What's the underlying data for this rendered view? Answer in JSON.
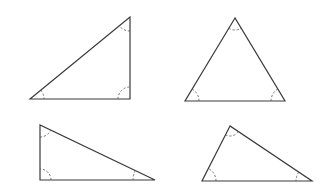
{
  "figure": {
    "background": "#ffffff",
    "line_color": "#3a3a3a",
    "arc_color": "#555555"
  },
  "triangles": [
    {
      "id": "triangle-top-left",
      "type": "right",
      "vertices": [
        [
          30,
          99
        ],
        [
          130,
          17
        ],
        [
          130,
          99
        ]
      ],
      "angle_marks": [
        {
          "vertex": [
            30,
            99
          ],
          "radius": 14
        },
        {
          "vertex": [
            130,
            17
          ],
          "radius": 14
        },
        {
          "vertex": [
            130,
            99
          ],
          "radius": 12
        }
      ]
    },
    {
      "id": "triangle-top-right",
      "type": "acute",
      "vertices": [
        [
          235,
          18
        ],
        [
          185,
          101
        ],
        [
          285,
          101
        ]
      ],
      "angle_marks": [
        {
          "vertex": [
            235,
            18
          ],
          "radius": 12
        },
        {
          "vertex": [
            185,
            101
          ],
          "radius": 14
        },
        {
          "vertex": [
            285,
            101
          ],
          "radius": 14
        }
      ]
    },
    {
      "id": "triangle-bottom-left",
      "type": "right",
      "vertices": [
        [
          40,
          125
        ],
        [
          40,
          180
        ],
        [
          155,
          180
        ]
      ],
      "angle_marks": [
        {
          "vertex": [
            40,
            125
          ],
          "radius": 12
        },
        {
          "vertex": [
            40,
            180
          ],
          "radius": 11
        },
        {
          "vertex": [
            155,
            180
          ],
          "radius": 22
        }
      ]
    },
    {
      "id": "triangle-bottom-right",
      "type": "obtuse",
      "vertices": [
        [
          230,
          126
        ],
        [
          202,
          181
        ],
        [
          312,
          181
        ]
      ],
      "angle_marks": [
        {
          "vertex": [
            230,
            126
          ],
          "radius": 10
        },
        {
          "vertex": [
            202,
            181
          ],
          "radius": 14
        },
        {
          "vertex": [
            312,
            181
          ],
          "radius": 16
        }
      ]
    }
  ]
}
